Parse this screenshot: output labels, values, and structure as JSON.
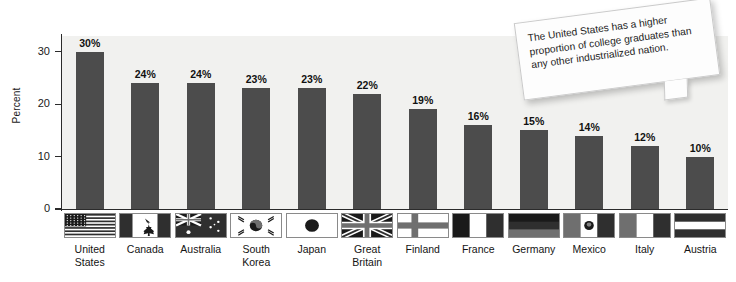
{
  "chart_data": {
    "type": "bar",
    "title": "",
    "xlabel": "",
    "ylabel": "Percent",
    "ylim": [
      0,
      33
    ],
    "yticks": [
      0,
      10,
      20,
      30
    ],
    "ytick_labels": [
      "0",
      "10",
      "20",
      "30"
    ],
    "grid": false,
    "legend": "none",
    "categories": [
      "United\nStates",
      "Canada",
      "Australia",
      "South\nKorea",
      "Japan",
      "Great\nBritain",
      "Finland",
      "France",
      "Germany",
      "Mexico",
      "Italy",
      "Austria"
    ],
    "values": [
      30,
      24,
      24,
      23,
      23,
      22,
      19,
      16,
      15,
      14,
      12,
      10
    ],
    "value_labels": [
      "30%",
      "24%",
      "24%",
      "23%",
      "23%",
      "22%",
      "19%",
      "16%",
      "15%",
      "14%",
      "12%",
      "10%"
    ],
    "flags": [
      "flag-united-states",
      "flag-canada",
      "flag-australia",
      "flag-south-korea",
      "flag-japan",
      "flag-great-britain",
      "flag-finland",
      "flag-france",
      "flag-germany",
      "flag-mexico",
      "flag-italy",
      "flag-austria"
    ],
    "annotations": [
      "The United States has a higher proportion of college graduates than any other industrialized nation."
    ],
    "colors": {
      "bar": "#4c4c4c",
      "plot_background": "#f1f1ef",
      "page_background": "#ffffff",
      "axis": "#2b2b2b",
      "text": "#141414",
      "callout_background": "#fdfdfd"
    }
  }
}
